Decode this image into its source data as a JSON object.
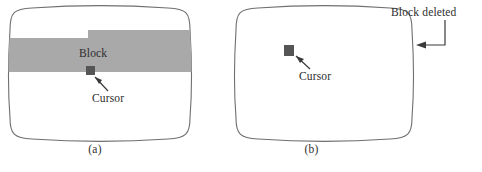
{
  "figure": {
    "type": "diagram",
    "colors": {
      "screen_outline": "#6f6f6f",
      "block_fill": "#a9a9a9",
      "cursor_fill": "#555555",
      "text": "#2d2d2d",
      "background": "#ffffff",
      "arrow": "#3a3a3a"
    }
  },
  "panels": [
    {
      "id": "a",
      "caption": "(a)",
      "screen_label": "screen-a",
      "block": {
        "label": "Block",
        "name": "highlighted-block",
        "shape": "stepped-band"
      },
      "cursor": {
        "label": "Cursor",
        "name": "cursor-marker"
      }
    },
    {
      "id": "b",
      "caption": "(b)",
      "screen_label": "screen-b",
      "cursor": {
        "label": "Cursor",
        "name": "cursor-marker"
      },
      "annotation": {
        "label": "Block deleted",
        "name": "block-deleted-annotation"
      }
    }
  ],
  "icons": {
    "pointer_a": "arrow-pointer-icon",
    "pointer_b": "arrow-pointer-icon",
    "leader_arrow": "leader-arrow-icon"
  }
}
